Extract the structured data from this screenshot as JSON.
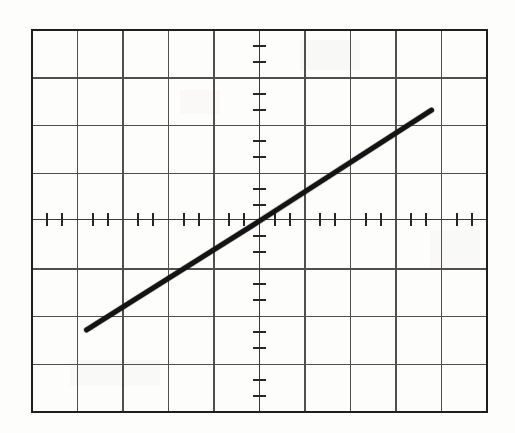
{
  "figure": {
    "kind": "scanned-graph-paper",
    "background_color": "#fdfdfc",
    "ink_color": "#1a1a1a",
    "grid_color": "#4a4a4a",
    "border_color": "#222222",
    "caption": ""
  },
  "chart_data": {
    "type": "line",
    "title": "",
    "subtitle": "",
    "xlabel": "",
    "ylabel": "",
    "legend": [],
    "annotations": [],
    "grid": true,
    "grid_major_columns": 10,
    "grid_major_rows": 8,
    "minor_ticks_per_cell_x": 3,
    "minor_ticks_per_cell_y": 3,
    "axis_origin_cell_x": 5,
    "axis_origin_cell_y": 4,
    "xlim": [
      -5,
      5
    ],
    "ylim": [
      -4,
      4
    ],
    "xticklabels": [],
    "yticklabels": [],
    "series": [
      {
        "name": "line",
        "line_color": "#141414",
        "line_width_px": 5,
        "x": [
          -3.8,
          0.0,
          3.78
        ],
        "y": [
          -2.28,
          0.0,
          2.32
        ],
        "slope": 0.6,
        "intercept": 0.0
      }
    ],
    "endpoints": {
      "start": {
        "x": -3.8,
        "y": -2.28
      },
      "end": {
        "x": 3.78,
        "y": 2.32
      }
    }
  }
}
